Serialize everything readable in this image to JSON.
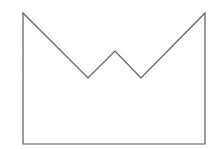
{
  "diagram": {
    "type": "outline-shape",
    "canvas": {
      "width": 220,
      "height": 149,
      "background": "#ffffff"
    },
    "shape": {
      "stroke": "#5a5a5a",
      "stroke_width": 1.2,
      "fill": "none",
      "points": [
        [
          23,
          13
        ],
        [
          88,
          78
        ],
        [
          115,
          51
        ],
        [
          141,
          78
        ],
        [
          205,
          13
        ],
        [
          205,
          144
        ],
        [
          23,
          144
        ]
      ]
    }
  }
}
